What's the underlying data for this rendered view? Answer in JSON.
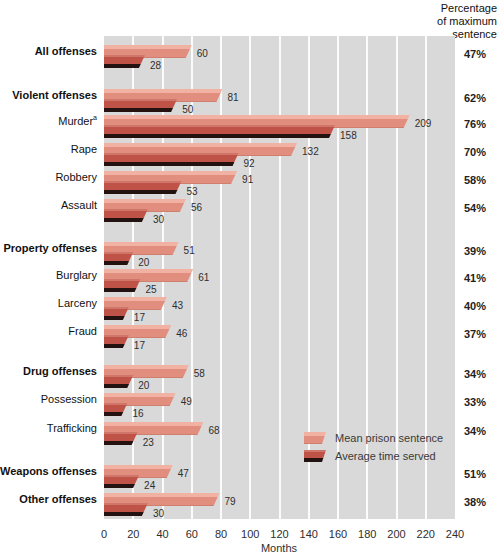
{
  "header": {
    "right_column": "Percentage\nof maximum\nsentence"
  },
  "chart_data": {
    "type": "bar",
    "orientation": "horizontal",
    "title": "",
    "xlabel": "Months",
    "ylabel": "",
    "xlim": [
      0,
      240
    ],
    "xticks": [
      0,
      20,
      40,
      60,
      80,
      100,
      120,
      140,
      160,
      180,
      200,
      220,
      240
    ],
    "grid": true,
    "legend_position": "inside-lower-right",
    "series": [
      {
        "name": "Mean prison sentence",
        "key": "mean",
        "color": "#e18e7e",
        "highlight": "#f1b2a3"
      },
      {
        "name": "Average time served",
        "key": "served",
        "color": "#c05347",
        "shadow": "#241210"
      }
    ],
    "rows": [
      {
        "label": "All offenses",
        "bold": true,
        "mean": 60,
        "served": 28,
        "pct": "47%"
      },
      {
        "label": "Violent offenses",
        "bold": true,
        "mean": 81,
        "served": 50,
        "pct": "62%"
      },
      {
        "label": "Murder",
        "sup": "a",
        "bold": false,
        "mean": 209,
        "served": 158,
        "pct": "76%"
      },
      {
        "label": "Rape",
        "bold": false,
        "mean": 132,
        "served": 92,
        "pct": "70%"
      },
      {
        "label": "Robbery",
        "bold": false,
        "mean": 91,
        "served": 53,
        "pct": "58%"
      },
      {
        "label": "Assault",
        "bold": false,
        "mean": 56,
        "served": 30,
        "pct": "54%"
      },
      {
        "label": "Property offenses",
        "bold": true,
        "mean": 51,
        "served": 20,
        "pct": "39%"
      },
      {
        "label": "Burglary",
        "bold": false,
        "mean": 61,
        "served": 25,
        "pct": "41%"
      },
      {
        "label": "Larceny",
        "bold": false,
        "mean": 43,
        "served": 17,
        "pct": "40%"
      },
      {
        "label": "Fraud",
        "bold": false,
        "mean": 46,
        "served": 17,
        "pct": "37%"
      },
      {
        "label": "Drug offenses",
        "bold": true,
        "mean": 58,
        "served": 20,
        "pct": "34%"
      },
      {
        "label": "Possession",
        "bold": false,
        "mean": 49,
        "served": 16,
        "pct": "33%"
      },
      {
        "label": "Trafficking",
        "bold": false,
        "mean": 68,
        "served": 23,
        "pct": "34%"
      },
      {
        "label": "Weapons offenses",
        "bold": true,
        "mean": 47,
        "served": 24,
        "pct": "51%"
      },
      {
        "label": "Other offenses",
        "bold": true,
        "mean": 79,
        "served": 30,
        "pct": "38%"
      }
    ],
    "colors": {
      "panel_bg": "#d9d9d9",
      "gridline": "#ffffff",
      "label_text": "#111111",
      "value_text": "#2e2e2e"
    }
  }
}
